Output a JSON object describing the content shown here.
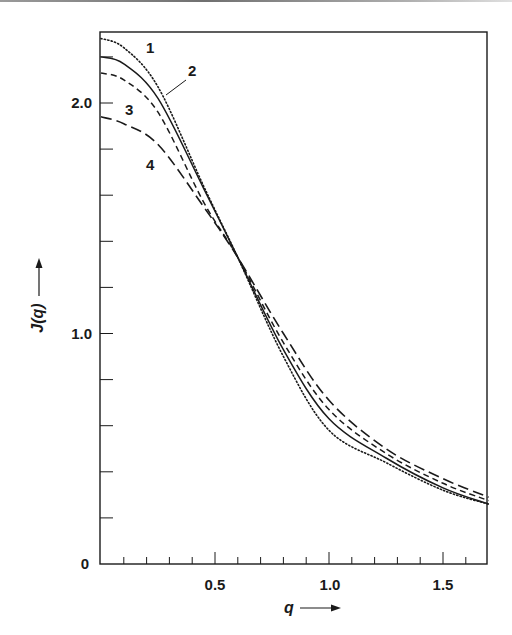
{
  "chart_data": {
    "type": "line",
    "title": "",
    "xlabel": "q",
    "ylabel": "J(q)",
    "xlim": [
      0,
      1.7
    ],
    "ylim": [
      0,
      2.31
    ],
    "grid": false,
    "legend": "inline numeric curve labels 1-4",
    "x_ticks": {
      "major": [
        0,
        0.5,
        1.0,
        1.5
      ],
      "major_labels": [
        "0",
        "0.5",
        "1.0",
        "1.5"
      ],
      "minor_step": 0.1
    },
    "y_ticks": {
      "major": [
        0,
        1.0,
        2.0
      ],
      "major_labels": [
        "0",
        "1.0",
        "2.0"
      ],
      "minor_step": 0.2
    },
    "x": [
      0,
      0.1,
      0.25,
      0.45,
      0.6,
      0.8,
      1.0,
      1.25,
      1.5,
      1.7
    ],
    "series": [
      {
        "name": "1",
        "style": "dotted",
        "values": [
          2.28,
          2.24,
          2.07,
          1.64,
          1.33,
          0.9,
          0.58,
          0.44,
          0.32,
          0.26
        ]
      },
      {
        "name": "2",
        "style": "solid",
        "values": [
          2.2,
          2.17,
          2.02,
          1.63,
          1.33,
          0.93,
          0.63,
          0.46,
          0.33,
          0.26
        ]
      },
      {
        "name": "3",
        "style": "short-dash",
        "values": [
          2.13,
          2.1,
          1.96,
          1.57,
          1.33,
          0.96,
          0.67,
          0.48,
          0.35,
          0.275
        ]
      },
      {
        "name": "4",
        "style": "long-dash",
        "values": [
          1.94,
          1.91,
          1.82,
          1.55,
          1.33,
          1.0,
          0.71,
          0.5,
          0.37,
          0.29
        ]
      }
    ],
    "annotations": [
      {
        "text": "1",
        "x": 0.26,
        "y": 2.27
      },
      {
        "text": "2",
        "x": 0.38,
        "y": 2.17,
        "leader_to": {
          "x": 0.3,
          "y": 2.04
        }
      },
      {
        "text": "3",
        "x": 0.2,
        "y": 1.98
      },
      {
        "text": "4",
        "x": 0.33,
        "y": 1.73
      }
    ]
  },
  "labels": {
    "x_axis": "q",
    "y_axis": "J(q)",
    "x_ticks": [
      "0.5",
      "1.0",
      "1.5"
    ],
    "y_ticks": [
      "2.0",
      "1.0"
    ],
    "origin": "0",
    "curve_1": "1",
    "curve_2": "2",
    "curve_3": "3",
    "curve_4": "4"
  },
  "colors": {
    "ink": "#1a1a1a",
    "background": "#ffffff"
  }
}
